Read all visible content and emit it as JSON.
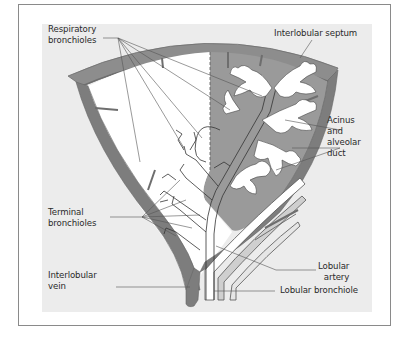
{
  "figure": {
    "type": "anatomical-diagram",
    "colors": {
      "background": "#ffffff",
      "panel": "#ececec",
      "septum": "#8d8d8d",
      "septum_dark": "#6e6e6e",
      "acinus_fill": "#9a9a9a",
      "white": "#ffffff",
      "line": "#333333",
      "frame_border": "#8a8a8a"
    },
    "labels": {
      "respiratory_bronchioles": "Respiratory\nbronchioles",
      "interlobular_septum": "Interlobular septum",
      "acinus_alveolar_duct": "Acinus\nand\nalveolar\nduct",
      "terminal_bronchioles": "Terminal\nbronchioles",
      "interlobular_vein": "Interlobular\nvein",
      "lobular_artery": "Lobular\nartery",
      "lobular_bronchiole": "Lobular bronchiole"
    }
  }
}
